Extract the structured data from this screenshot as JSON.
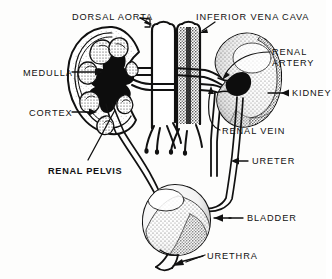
{
  "figure": {
    "style": {
      "line_color": "#111111",
      "fill_color": "#ffffff",
      "dark_fill": "#111111",
      "stipple_color": "#5a5a5a",
      "background": "#fdfdfc"
    }
  },
  "labels": [
    {
      "id": "dorsal-aorta",
      "text": "DORSAL AORTA",
      "bold": false,
      "x": 72,
      "y": 12,
      "align": "left"
    },
    {
      "id": "inferior-vena-cava",
      "text": "INFERIOR VENA CAVA",
      "bold": false,
      "x": 196,
      "y": 12,
      "align": "left"
    },
    {
      "id": "renal-artery-l1",
      "text": "RENAL",
      "bold": false,
      "x": 272,
      "y": 47,
      "align": "left"
    },
    {
      "id": "renal-artery-l2",
      "text": "ARTERY",
      "bold": false,
      "x": 272,
      "y": 58,
      "align": "left"
    },
    {
      "id": "medulla",
      "text": "MEDULLA",
      "bold": false,
      "x": 23,
      "y": 68,
      "align": "left"
    },
    {
      "id": "kidney",
      "text": "KIDNEY",
      "bold": false,
      "x": 270,
      "y": 90,
      "align": "left"
    },
    {
      "id": "cortex",
      "text": "CORTEX",
      "bold": false,
      "x": 29,
      "y": 108,
      "align": "left"
    },
    {
      "id": "renal-vein",
      "text": "RENAL VEIN",
      "bold": false,
      "x": 222,
      "y": 128,
      "align": "left"
    },
    {
      "id": "ureter",
      "text": "URETER",
      "bold": false,
      "x": 237,
      "y": 158,
      "align": "left"
    },
    {
      "id": "renal-pelvis",
      "text": "RENAL PELVIS",
      "bold": true,
      "x": 48,
      "y": 166,
      "align": "left"
    },
    {
      "id": "bladder",
      "text": "BLADDER",
      "bold": false,
      "x": 231,
      "y": 215,
      "align": "left"
    },
    {
      "id": "urethra",
      "text": "URETHRA",
      "bold": false,
      "x": 207,
      "y": 252,
      "align": "left"
    }
  ],
  "structures": [
    {
      "id": "left-kidney",
      "name": "Left kidney (cut-away cross-section)"
    },
    {
      "id": "right-kidney",
      "name": "Right kidney (whole, stippled)"
    },
    {
      "id": "aorta",
      "name": "Dorsal aorta trunk"
    },
    {
      "id": "vena-cava",
      "name": "Inferior vena cava trunk"
    },
    {
      "id": "renal-artery-vessels",
      "name": "Renal arteries"
    },
    {
      "id": "renal-vein-vessels",
      "name": "Renal veins"
    },
    {
      "id": "left-ureter",
      "name": "Left ureter"
    },
    {
      "id": "right-ureter",
      "name": "Right ureter"
    },
    {
      "id": "bladder",
      "name": "Urinary bladder"
    },
    {
      "id": "urethra",
      "name": "Urethra"
    },
    {
      "id": "renal-pelvis",
      "name": "Renal pelvis"
    },
    {
      "id": "medulla",
      "name": "Renal medulla / pyramids"
    },
    {
      "id": "cortex",
      "name": "Renal cortex"
    }
  ]
}
